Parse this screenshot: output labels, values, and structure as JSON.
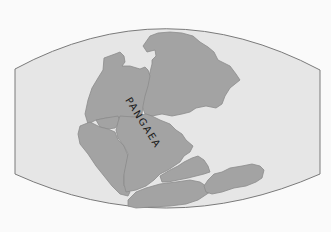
{
  "map": {
    "title": "PANGAEA",
    "label_text": "PANGAEA",
    "colors": {
      "background": "#fafafa",
      "ocean": "#e6e6e6",
      "land": "#a3a3a3",
      "coast": "#8c8c8c",
      "frame": "#7a7a7a",
      "label": "#1a1a1a"
    },
    "regions": [
      {
        "name": "laurasia-north-america"
      },
      {
        "name": "laurasia-eurasia"
      },
      {
        "name": "gondwana-south-america"
      },
      {
        "name": "gondwana-africa"
      },
      {
        "name": "gondwana-small-block"
      },
      {
        "name": "gondwana-india"
      },
      {
        "name": "gondwana-antarctica"
      },
      {
        "name": "gondwana-australia"
      }
    ]
  }
}
